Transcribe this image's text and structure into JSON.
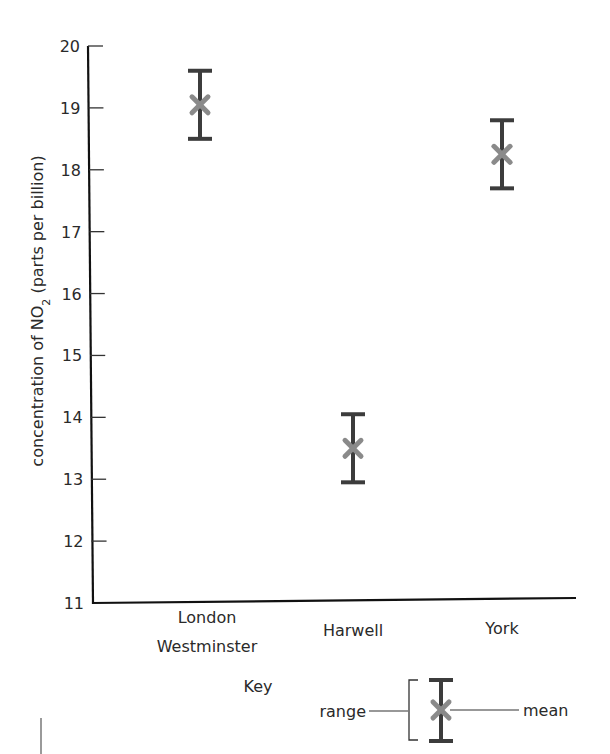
{
  "chart_data": {
    "type": "errorbar",
    "title": "",
    "xlabel": "",
    "ylabel": "concentration of NO2 (parts per billion)",
    "ylabel_parts": {
      "prefix": "concentration of NO",
      "subscript": "2",
      "suffix": " (parts per billion)"
    },
    "ylim": [
      11,
      20
    ],
    "yticks": [
      11,
      12,
      13,
      14,
      15,
      16,
      17,
      18,
      19,
      20
    ],
    "grid": false,
    "categories": [
      "London Westminster",
      "Harwell",
      "York"
    ],
    "category_label_lines": [
      [
        "London",
        "Westminster"
      ],
      [
        "Harwell"
      ],
      [
        "York"
      ]
    ],
    "series": [
      {
        "name": "mean",
        "marker": "x",
        "values": [
          19.05,
          13.5,
          18.25
        ]
      },
      {
        "name": "range_min",
        "values": [
          18.5,
          12.95,
          17.7
        ]
      },
      {
        "name": "range_max",
        "values": [
          19.6,
          14.05,
          18.8
        ]
      }
    ],
    "legend": {
      "title": "Key",
      "position": "bottom",
      "entries": [
        {
          "label": "range",
          "symbol": "error-bar"
        },
        {
          "label": "mean",
          "symbol": "x-marker"
        }
      ]
    }
  },
  "colors": {
    "axis": "#111111",
    "error_bar": "#3c3c3c",
    "mean_marker": "#8a8a8a",
    "text": "#2a2a2a"
  }
}
